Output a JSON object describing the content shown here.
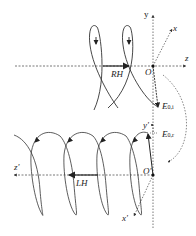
{
  "diagram": {
    "type": "helix-reflection-schematic",
    "top_panel": {
      "handedness_label": "RH",
      "origin_label": "O",
      "axes": {
        "x": "x",
        "y": "y",
        "z": "z"
      },
      "field_label": "E",
      "field_subscript": "0,i"
    },
    "bottom_panel": {
      "handedness_label": "LH",
      "origin_label": "O'",
      "axes": {
        "x": "x'",
        "y": "y'",
        "z": "z'"
      },
      "field_label": "E",
      "field_subscript": "0,r"
    },
    "colors": {
      "line": "#333333",
      "dashed": "#555555",
      "background": "#ffffff"
    }
  }
}
